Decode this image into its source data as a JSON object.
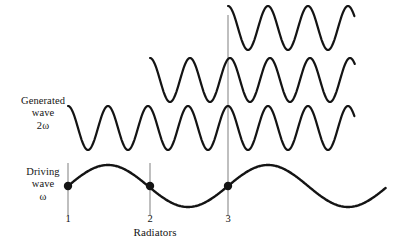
{
  "figure": {
    "background_color": "#ffffff",
    "wave_color": "#141414",
    "marker_color": "#141414",
    "guide_line_color": "#8a8a8a",
    "width": 397,
    "height": 248
  },
  "labels": {
    "generated_wave": {
      "line1": "Generated",
      "line2": "wave",
      "line3": "2ω"
    },
    "driving_wave": {
      "line1": "Driving",
      "line2": "wave",
      "line3": "ω"
    },
    "caption": "Radiators"
  },
  "radiators": [
    {
      "number": "1",
      "x": 68,
      "dot_y": 186,
      "tick_top": 163,
      "tick_bottom": 216
    },
    {
      "number": "2",
      "x": 150,
      "dot_y": 186,
      "tick_top": 163,
      "tick_bottom": 216
    },
    {
      "number": "3",
      "x": 228,
      "dot_y": 186,
      "tick_top": 15,
      "tick_bottom": 216
    }
  ],
  "chart_data": {
    "type": "line",
    "xlabel": "Radiators",
    "ylabel": "",
    "grid": false,
    "legend": "none",
    "annotations": [
      "Generated wave 2ω",
      "Driving wave ω",
      "Radiators"
    ],
    "series": [
      {
        "name": "generated-wave-from-radiator-3",
        "frequency_label": "2ω",
        "phase_origin_radiator": "3",
        "x_start": 228,
        "x_end": 355,
        "baseline_y": 28,
        "amplitude": 22,
        "period_px": 40,
        "start_phase": "peak"
      },
      {
        "name": "generated-wave-from-radiator-2",
        "frequency_label": "2ω",
        "phase_origin_radiator": "2",
        "x_start": 150,
        "x_end": 355,
        "baseline_y": 80,
        "amplitude": 22,
        "period_px": 40,
        "start_phase": "peak"
      },
      {
        "name": "generated-wave-from-radiator-1",
        "frequency_label": "2ω",
        "phase_origin_radiator": "1",
        "x_start": 68,
        "x_end": 355,
        "baseline_y": 128,
        "amplitude": 22,
        "period_px": 40,
        "start_phase": "peak"
      },
      {
        "name": "driving-wave",
        "frequency_label": "ω",
        "x_start": 68,
        "x_end": 386,
        "baseline_y": 186,
        "amplitude": 21,
        "period_px": 160,
        "start_phase": "zero-rising"
      }
    ]
  }
}
